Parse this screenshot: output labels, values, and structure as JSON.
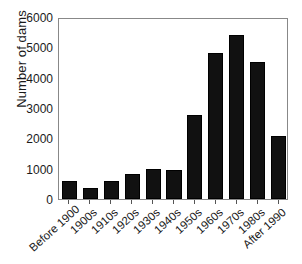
{
  "chart_data": {
    "type": "bar",
    "title": "",
    "xlabel": "",
    "ylabel": "Number of dams",
    "categories": [
      "Before 1900",
      "1900s",
      "1910s",
      "1920s",
      "1930s",
      "1940s",
      "1950s",
      "1960s",
      "1970s",
      "1980s",
      "After 1990"
    ],
    "values": [
      600,
      360,
      590,
      820,
      990,
      950,
      2760,
      4820,
      5420,
      4510,
      2080
    ],
    "ylim": [
      0,
      6000
    ],
    "yticks": [
      0,
      1000,
      2000,
      3000,
      4000,
      5000,
      6000
    ],
    "ytick_labels": [
      "0",
      "1000",
      "2000",
      "3000",
      "4000",
      "5000",
      "6000"
    ],
    "grid": false,
    "legend": null,
    "bar_color": "#111111",
    "axis_color": "#888888"
  }
}
